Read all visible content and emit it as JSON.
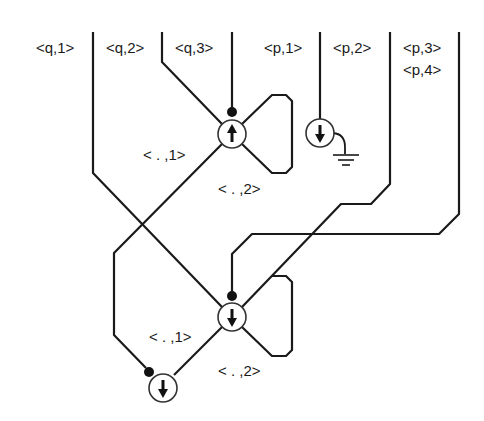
{
  "diagram": {
    "ports_top": [
      {
        "label": "<q,1>",
        "x": 93
      },
      {
        "label": "<q,2>",
        "x": 162
      },
      {
        "label": "<q,3>",
        "x": 232
      },
      {
        "label": "<p,1>",
        "x": 320
      },
      {
        "label": "<p,2>",
        "x": 390
      },
      {
        "label": "<p,3>",
        "x": 459
      },
      {
        "label": "<p,4>",
        "x": 459
      }
    ],
    "nodes": [
      {
        "id": "upper-node",
        "arrow": "up",
        "labels": [
          "< . ,1>",
          "< . ,2>"
        ]
      },
      {
        "id": "ground-node",
        "arrow": "down",
        "grounded": true
      },
      {
        "id": "middle-node",
        "arrow": "down",
        "labels": [
          "< . ,1>",
          "< . ,2>"
        ]
      },
      {
        "id": "bottom-node",
        "arrow": "down"
      }
    ],
    "label_upper_1": "< . ,1>",
    "label_upper_2": "< . ,2>",
    "label_middle_1": "< . ,1>",
    "label_middle_2": "< . ,2>"
  }
}
